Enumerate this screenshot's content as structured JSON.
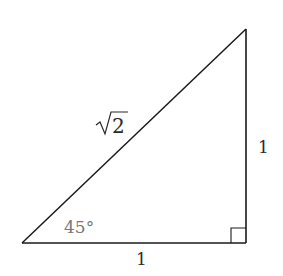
{
  "diagram": {
    "colors": {
      "stroke": "#1a1a1a",
      "label": "#2a2a2a",
      "angle_label": "#777777",
      "background": "#ffffff"
    },
    "vertices": {
      "bottom_left": [
        22,
        243
      ],
      "bottom_right": [
        246,
        243
      ],
      "top_right": [
        246,
        29
      ]
    },
    "labels": {
      "hypotenuse": "√2",
      "vertical_leg": "1",
      "horizontal_leg": "1",
      "angle": "45°"
    },
    "right_angle_marker": {
      "corner": "bottom_right",
      "size": 15
    }
  }
}
